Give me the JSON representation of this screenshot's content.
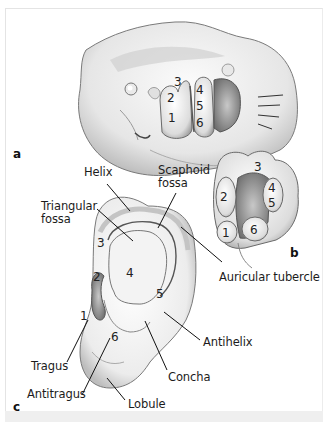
{
  "figure": {
    "panels": [
      {
        "letter": "a",
        "description": "Embryo head showing six auricular hillocks",
        "hillocks": [
          "1",
          "2",
          "3",
          "4",
          "5",
          "6"
        ]
      },
      {
        "letter": "b",
        "description": "Auricular hillocks around first pharyngeal cleft",
        "hillocks": [
          "1",
          "2",
          "3",
          "4",
          "5",
          "6"
        ]
      },
      {
        "letter": "c",
        "description": "Adult auricle with hillock derivatives",
        "hillocks": [
          "1",
          "2",
          "3",
          "4",
          "5",
          "6"
        ]
      }
    ],
    "labels": {
      "helix": "Helix",
      "scaphoid_fossa_1": "Scaphoid",
      "scaphoid_fossa_2": "fossa",
      "triangular_fossa_1": "Triangular",
      "triangular_fossa_2": "fossa",
      "auricular_tubercle": "Auricular tubercle",
      "antihelix": "Antihelix",
      "tragus": "Tragus",
      "concha": "Concha",
      "antitragus": "Antitragus",
      "lobule": "Lobule"
    },
    "numbers": {
      "n1": "1",
      "n2": "2",
      "n3": "3",
      "n4": "4",
      "n5": "5",
      "n6": "6"
    }
  }
}
